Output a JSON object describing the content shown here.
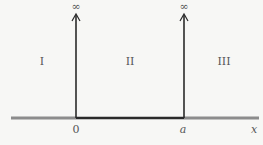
{
  "diagram": {
    "infinity_left": "∞",
    "infinity_right": "∞",
    "regions": [
      "I",
      "II",
      "III"
    ],
    "axis": {
      "origin_label": "0",
      "wall_label": "a",
      "axis_label": "x"
    },
    "colors": {
      "axis": "#888888",
      "walls": "#2a2a2a",
      "background": "#f7f7f5"
    }
  }
}
